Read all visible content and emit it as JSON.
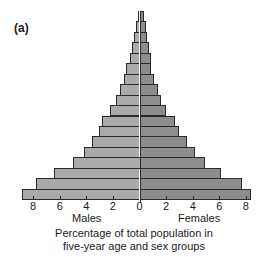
{
  "panel_label": "(a)",
  "chart_data": {
    "type": "bar",
    "orientation": "horizontal",
    "subtype": "population-pyramid",
    "title": "",
    "xlabel": "Percentage of total population in five-year age and sex groups",
    "ylabel": "",
    "xlim": [
      -8.8,
      8.8
    ],
    "x_ticks": [
      8,
      6,
      4,
      2,
      0,
      2,
      4,
      6,
      8
    ],
    "grid": false,
    "legend": {
      "left": "Males",
      "right": "Females"
    },
    "categories_top_to_bottom": [
      "age-group-18",
      "age-group-17",
      "age-group-16",
      "age-group-15",
      "age-group-14",
      "age-group-13",
      "age-group-12",
      "age-group-11",
      "age-group-10",
      "age-group-9",
      "age-group-8",
      "age-group-7",
      "age-group-6",
      "age-group-5",
      "age-group-4",
      "age-group-3",
      "age-group-2",
      "age-group-1"
    ],
    "series": [
      {
        "name": "Males",
        "color": "#aaaaaa",
        "values": [
          0.15,
          0.3,
          0.4,
          0.55,
          0.7,
          1.0,
          1.2,
          1.5,
          1.8,
          2.25,
          2.8,
          3.05,
          3.55,
          4.15,
          5.0,
          6.4,
          7.8,
          8.8
        ]
      },
      {
        "name": "Females",
        "color": "#8d8d8d",
        "values": [
          0.35,
          0.5,
          0.6,
          0.7,
          0.85,
          0.9,
          1.1,
          1.4,
          1.6,
          2.0,
          2.7,
          3.0,
          3.6,
          4.2,
          4.9,
          6.1,
          7.7,
          8.4
        ]
      }
    ]
  },
  "axis": {
    "tick_labels": [
      "8",
      "6",
      "4",
      "2",
      "0",
      "2",
      "4",
      "6",
      "8"
    ],
    "males_label": "Males",
    "females_label": "Females",
    "caption_line1": "Percentage of total population in",
    "caption_line2": "five-year age and sex groups"
  }
}
